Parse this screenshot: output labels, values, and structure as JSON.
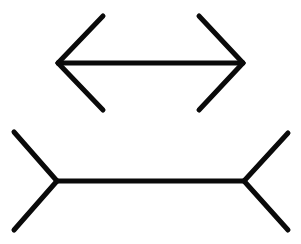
{
  "figure": {
    "name": "Muller-Lyer illusion",
    "type": "line-drawing",
    "canvas": {
      "width": 301,
      "height": 244,
      "background": "#ffffff"
    },
    "stroke": {
      "color": "#0a0a0a",
      "shaft_width": 5,
      "fin_width": 5
    },
    "shapes": [
      {
        "id": "top-figure",
        "label": "double-headed arrow with inward fins",
        "shaft": {
          "x1": 58,
          "y1": 63,
          "x2": 243,
          "y2": 63,
          "length": 185
        },
        "fins": [
          {
            "id": "top-left-upper-fin",
            "x1": 58,
            "y1": 63,
            "x2": 103,
            "y2": 16
          },
          {
            "id": "top-left-lower-fin",
            "x1": 58,
            "y1": 63,
            "x2": 103,
            "y2": 110
          },
          {
            "id": "top-right-upper-fin",
            "x1": 243,
            "y1": 63,
            "x2": 199,
            "y2": 16
          },
          {
            "id": "top-right-lower-fin",
            "x1": 243,
            "y1": 63,
            "x2": 199,
            "y2": 110
          }
        ]
      },
      {
        "id": "bottom-figure",
        "label": "double-tailed arrow with outward fins",
        "shaft": {
          "x1": 57,
          "y1": 181,
          "x2": 244,
          "y2": 181,
          "length": 187
        },
        "fins": [
          {
            "id": "bottom-left-upper-fin",
            "x1": 57,
            "y1": 181,
            "x2": 14,
            "y2": 132
          },
          {
            "id": "bottom-left-lower-fin",
            "x1": 57,
            "y1": 181,
            "x2": 14,
            "y2": 230
          },
          {
            "id": "bottom-right-upper-fin",
            "x1": 244,
            "y1": 181,
            "x2": 288,
            "y2": 133
          },
          {
            "id": "bottom-right-lower-fin",
            "x1": 244,
            "y1": 181,
            "x2": 288,
            "y2": 230
          }
        ]
      }
    ]
  }
}
